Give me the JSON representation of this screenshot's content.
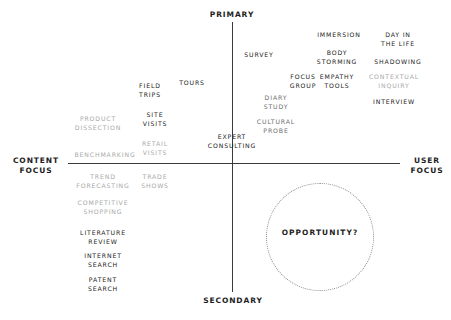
{
  "diagram": {
    "axes": {
      "top_label": "PRIMARY",
      "bottom_label": "SECONDARY",
      "left_label": "CONTENT\nFOCUS",
      "right_label": "USER\nFOCUS",
      "line_color": "#3a3a3a"
    },
    "highlight": {
      "label": "OPPORTUNITY?",
      "shape": "dotted-circle",
      "quadrant": "secondary-user-focus",
      "border_color": "#8d8d8d"
    },
    "methods": [
      {
        "label": "SURVEY",
        "x": 259,
        "y": 51,
        "tone": "dark"
      },
      {
        "label": "IMMERSION",
        "x": 339,
        "y": 31,
        "tone": "dark"
      },
      {
        "label": "DAY IN\nTHE LIFE",
        "x": 398,
        "y": 31,
        "tone": "dark"
      },
      {
        "label": "BODY\nSTORMING",
        "x": 337,
        "y": 49,
        "tone": "dark"
      },
      {
        "label": "SHADOWING",
        "x": 398,
        "y": 58,
        "tone": "dark"
      },
      {
        "label": "FOCUS\nGROUP",
        "x": 303,
        "y": 73,
        "tone": "dark"
      },
      {
        "label": "EMPATHY\nTOOLS",
        "x": 337,
        "y": 73,
        "tone": "dark"
      },
      {
        "label": "CONTEXTUAL\nINQUIRY",
        "x": 394,
        "y": 73,
        "tone": "faint"
      },
      {
        "label": "INTERVIEW",
        "x": 394,
        "y": 98,
        "tone": "dark"
      },
      {
        "label": "DIARY\nSTUDY",
        "x": 276,
        "y": 94,
        "tone": "mid"
      },
      {
        "label": "CULTURAL\nPROBE",
        "x": 276,
        "y": 118,
        "tone": "mid"
      },
      {
        "label": "FIELD\nTRIPS",
        "x": 150,
        "y": 82,
        "tone": "dark"
      },
      {
        "label": "TOURS",
        "x": 192,
        "y": 79,
        "tone": "dark"
      },
      {
        "label": "SITE\nVISITS",
        "x": 155,
        "y": 111,
        "tone": "dark"
      },
      {
        "label": "PRODUCT\nDISSECTION",
        "x": 98,
        "y": 115,
        "tone": "faint"
      },
      {
        "label": "RETAIL\nVISITS",
        "x": 155,
        "y": 140,
        "tone": "faint"
      },
      {
        "label": "BENCHMARKING",
        "x": 105,
        "y": 151,
        "tone": "faint"
      },
      {
        "label": "EXPERT\nCONSULTING",
        "x": 232,
        "y": 133,
        "tone": "dark"
      },
      {
        "label": "TREND\nFORECASTING",
        "x": 103,
        "y": 173,
        "tone": "faint"
      },
      {
        "label": "TRADE\nSHOWS",
        "x": 155,
        "y": 173,
        "tone": "faint"
      },
      {
        "label": "COMPETITIVE\nSHOPPING",
        "x": 103,
        "y": 199,
        "tone": "faint"
      },
      {
        "label": "LITERATURE\nREVIEW",
        "x": 103,
        "y": 229,
        "tone": "dark"
      },
      {
        "label": "INTERNET\nSEARCH",
        "x": 103,
        "y": 252,
        "tone": "dark"
      },
      {
        "label": "PATENT\nSEARCH",
        "x": 103,
        "y": 276,
        "tone": "dark"
      }
    ]
  }
}
